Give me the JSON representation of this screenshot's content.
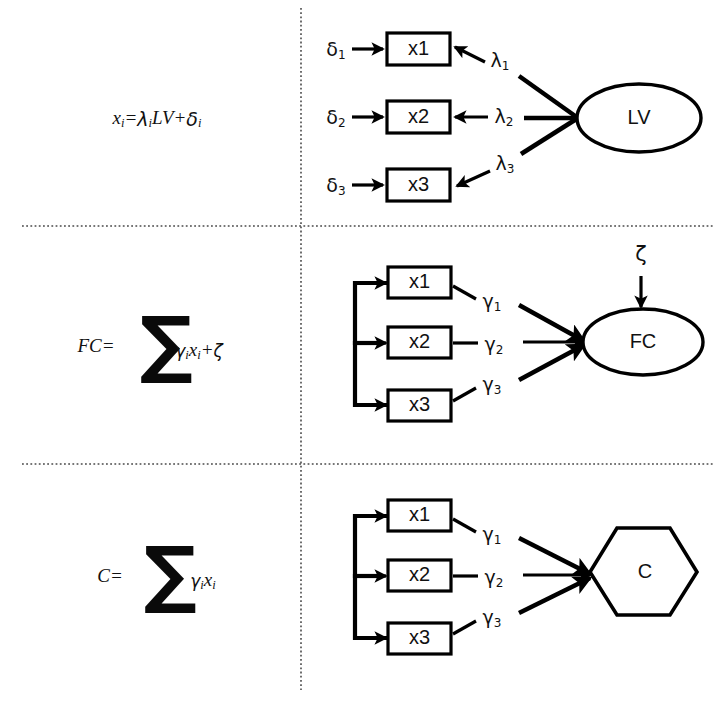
{
  "figure": {
    "width": 727,
    "height": 707,
    "background": "#ffffff",
    "stroke_color": "#000000"
  },
  "dividers": {
    "vertical_label": "vertical-dotted-divider",
    "horizontal_1_label": "horizontal-dotted-divider-1",
    "horizontal_2_label": "horizontal-dotted-divider-2"
  },
  "panels": [
    {
      "id": "panel-reflective",
      "formula": {
        "lhs": "x",
        "lhs_sub": "i",
        "eq": "=",
        "coef": "λ",
        "coef_sub": "i",
        "construct": "LV",
        "plus": "+",
        "error": "δ",
        "error_sub": "i",
        "plain": "xi = λi LV + δi"
      },
      "indicators": [
        {
          "label": "x1",
          "error": "δ",
          "error_sub": "1",
          "loading": "λ",
          "loading_sub": "1"
        },
        {
          "label": "x2",
          "error": "δ",
          "error_sub": "2",
          "loading": "λ",
          "loading_sub": "2"
        },
        {
          "label": "x3",
          "error": "δ",
          "error_sub": "3",
          "loading": "λ",
          "loading_sub": "3"
        }
      ],
      "construct": {
        "label": "LV",
        "shape": "ellipse"
      }
    },
    {
      "id": "panel-formative-fc",
      "formula": {
        "lhs": "FC",
        "eq": "=",
        "sigma": "∑",
        "coef": "γ",
        "coef_sub": "i",
        "var": "x",
        "var_sub": "i",
        "plus": "+",
        "error": "ζ",
        "plain": "FC = ∑ γi xi + ζ"
      },
      "indicators": [
        {
          "label": "x1",
          "weight": "γ",
          "weight_sub": "1"
        },
        {
          "label": "x2",
          "weight": "γ",
          "weight_sub": "2"
        },
        {
          "label": "x3",
          "weight": "γ",
          "weight_sub": "3"
        }
      ],
      "construct": {
        "label": "FC",
        "shape": "ellipse"
      },
      "disturbance": {
        "label": "ζ"
      }
    },
    {
      "id": "panel-composite-c",
      "formula": {
        "lhs": "C",
        "eq": "=",
        "sigma": "∑",
        "coef": "γ",
        "coef_sub": "i",
        "var": "x",
        "var_sub": "i",
        "plain": "C = ∑ γi xi"
      },
      "indicators": [
        {
          "label": "x1",
          "weight": "γ",
          "weight_sub": "1"
        },
        {
          "label": "x2",
          "weight": "γ",
          "weight_sub": "2"
        },
        {
          "label": "x3",
          "weight": "γ",
          "weight_sub": "3"
        }
      ],
      "construct": {
        "label": "C",
        "shape": "hexagon"
      }
    }
  ]
}
